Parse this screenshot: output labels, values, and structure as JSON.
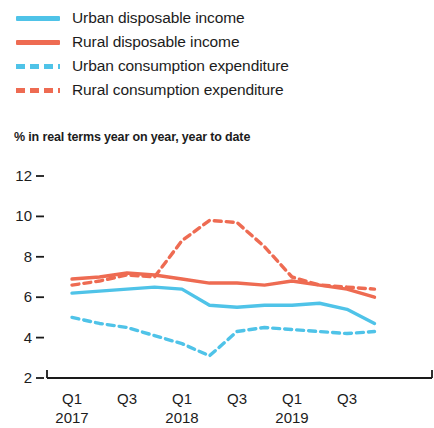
{
  "legend": {
    "items": [
      {
        "label": "Urban disposable income",
        "color": "#4FC3E8",
        "style": "solid",
        "name": "urban-disposable-income"
      },
      {
        "label": "Rural disposable income",
        "color": "#EE6B52",
        "style": "solid",
        "name": "rural-disposable-income"
      },
      {
        "label": "Urban consumption expenditure",
        "color": "#4FC3E8",
        "style": "dashed",
        "name": "urban-consumption-expenditure"
      },
      {
        "label": "Rural consumption expenditure",
        "color": "#EE6B52",
        "style": "dashed",
        "name": "rural-consumption-expenditure"
      }
    ]
  },
  "subtitle": "% in real terms year on year, year to date",
  "axis": {
    "y_ticks": [
      "12",
      "10",
      "8",
      "6",
      "4",
      "2"
    ],
    "x_quarters": [
      "Q1",
      "Q3",
      "Q1",
      "Q3",
      "Q1",
      "Q3"
    ],
    "x_years": [
      "2017",
      "2018",
      "2019"
    ]
  },
  "chart_data": {
    "type": "line",
    "title": "",
    "subtitle": "% in real terms year on year, year to date",
    "xlabel": "",
    "ylabel": "% in real terms year on year, year to date",
    "ylim": [
      2,
      12
    ],
    "ytick_values": [
      12,
      10,
      8,
      6,
      4,
      2
    ],
    "grid": false,
    "legend_position": "top-left",
    "x": [
      "2017 Q1",
      "2017 Q2",
      "2017 Q3",
      "2017 Q4",
      "2018 Q1",
      "2018 Q2",
      "2018 Q3",
      "2018 Q4",
      "2019 Q1",
      "2019 Q2",
      "2019 Q3",
      "2019 Q4"
    ],
    "xtick_labels": [
      "Q1 2017",
      "Q3",
      "Q1 2018",
      "Q3",
      "Q1 2019",
      "Q3"
    ],
    "series": [
      {
        "name": "Urban disposable income",
        "color": "#4FC3E8",
        "style": "solid",
        "values": [
          6.2,
          6.3,
          6.4,
          6.5,
          6.4,
          5.6,
          5.5,
          5.6,
          5.6,
          5.7,
          5.4,
          4.7
        ]
      },
      {
        "name": "Rural disposable income",
        "color": "#EE6B52",
        "style": "solid",
        "values": [
          6.9,
          7.0,
          7.2,
          7.1,
          6.9,
          6.7,
          6.7,
          6.6,
          6.8,
          6.6,
          6.4,
          6.0
        ]
      },
      {
        "name": "Urban consumption expenditure",
        "color": "#4FC3E8",
        "style": "dashed",
        "values": [
          5.0,
          4.7,
          4.5,
          4.1,
          3.7,
          3.1,
          4.3,
          4.5,
          4.4,
          4.3,
          4.2,
          4.3
        ]
      },
      {
        "name": "Rural consumption expenditure",
        "color": "#EE6B52",
        "style": "dashed",
        "values": [
          6.6,
          6.8,
          7.1,
          7.0,
          8.8,
          9.8,
          9.7,
          8.5,
          7.0,
          6.6,
          6.5,
          6.4
        ]
      }
    ]
  },
  "colors": {
    "blue": "#4FC3E8",
    "red": "#EE6B52",
    "axis": "#1a1a1a",
    "text": "#1c1c1c"
  }
}
